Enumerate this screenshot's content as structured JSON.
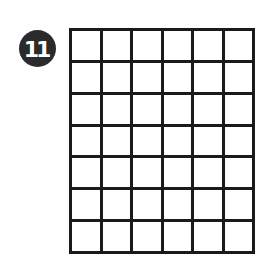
{
  "badge": {
    "number": "11",
    "color": "#2b2b2b"
  },
  "grid": {
    "rows": 7,
    "columns": 6,
    "line_color": "#1a1a1a"
  }
}
